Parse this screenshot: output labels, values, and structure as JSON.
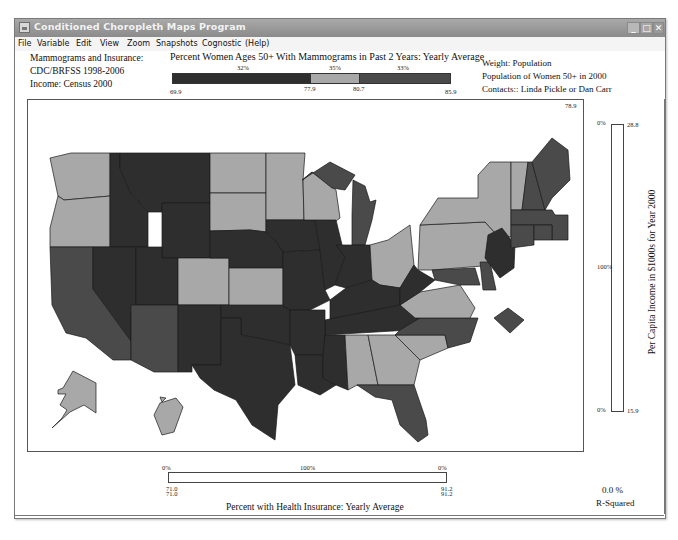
{
  "window": {
    "title": "Conditioned Choropleth Maps Program",
    "controls": {
      "minimize": "_",
      "maximize": "□",
      "close": "✕"
    }
  },
  "menu": [
    "File",
    "Variable",
    "Edit",
    "View",
    "Zoom",
    "Snapshots",
    "Cognostic",
    "(Help)"
  ],
  "info_left": {
    "line1": "Mammograms and Insurance:",
    "line2": "CDC/BRFSS 1998-2006",
    "line3": "Income:  Census 2000"
  },
  "info_right": {
    "line1": "Weight: Population",
    "line2": "Population of Women 50+ in 2000",
    "line3": "Contacts::  Linda Pickle or Dan Carr"
  },
  "color_legend": {
    "title": "Percent Women Ages 50+ With Mammograms in Past 2 Years: Yearly Average",
    "segments": [
      {
        "pct": "32%",
        "color": "#2e2e2e"
      },
      {
        "pct": "35%",
        "color": "#a8a8a8"
      },
      {
        "pct": "33%",
        "color": "#4a4a4a"
      }
    ],
    "breaks": [
      "69.9",
      "77.9",
      "80.7",
      "85.9"
    ]
  },
  "map": {
    "corner_value": "78.9",
    "colors": {
      "low": "#2e2e2e",
      "mid": "#a8a8a8",
      "high": "#4a4a4a",
      "border": "#1a1a1a"
    }
  },
  "vertical_slider": {
    "top_pct": "0%",
    "mid_pct": "100%",
    "bottom_pct": "0%",
    "top_value": "28.8",
    "bottom_value": "15.9",
    "label": "Per Capita  Income in $1000s for Year 2000"
  },
  "horizontal_slider": {
    "left_pct": "0%",
    "mid_pct": "100%",
    "right_pct": "0%",
    "left_values": [
      "71.0",
      "71.0"
    ],
    "right_values": [
      "91.2",
      "91.2"
    ],
    "label": "Percent with Health Insurance: Yearly Average"
  },
  "r_squared": {
    "value": "0.0 %",
    "label": "R-Squared"
  }
}
